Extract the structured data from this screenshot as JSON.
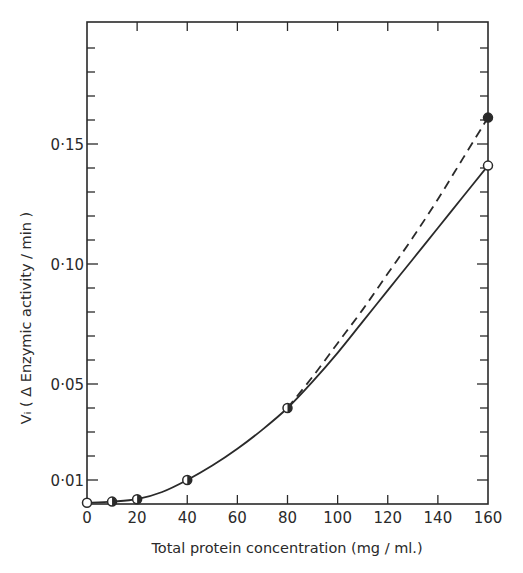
{
  "chart_data": {
    "type": "line",
    "title": "",
    "xlabel": "Total protein concentration (mg / ml.)",
    "ylabel": "Vᵢ ( Δ Enzymic activity / min )",
    "xlim": [
      0,
      160
    ],
    "ylim": [
      0,
      0.2
    ],
    "x_ticks": [
      0,
      20,
      40,
      60,
      80,
      100,
      120,
      140,
      160
    ],
    "x_tick_labels": [
      "0",
      "20",
      "40",
      "60",
      "80",
      "100",
      "120",
      "140",
      "160"
    ],
    "y_labeled_ticks": [
      {
        "value": 0.01,
        "label": "0·01"
      },
      {
        "value": 0.05,
        "label": "0·05"
      },
      {
        "value": 0.1,
        "label": "0·10"
      },
      {
        "value": 0.15,
        "label": "0·15"
      }
    ],
    "y_minor_step": 0.01,
    "grid": false,
    "legend": null,
    "series": [
      {
        "name": "open circles (solid line)",
        "line_style": "solid",
        "marker": "open-circle",
        "x": [
          0,
          10,
          20,
          40,
          80,
          160
        ],
        "values": [
          0.0005,
          0.001,
          0.002,
          0.01,
          0.04,
          0.141
        ],
        "curve": [
          [
            0,
            0.0005
          ],
          [
            10,
            0.001
          ],
          [
            20,
            0.002
          ],
          [
            30,
            0.005
          ],
          [
            40,
            0.01
          ],
          [
            50,
            0.016
          ],
          [
            60,
            0.023
          ],
          [
            70,
            0.031
          ],
          [
            80,
            0.04
          ],
          [
            90,
            0.051
          ],
          [
            100,
            0.063
          ],
          [
            110,
            0.076
          ],
          [
            120,
            0.089
          ],
          [
            130,
            0.102
          ],
          [
            140,
            0.115
          ],
          [
            150,
            0.128
          ],
          [
            160,
            0.141
          ]
        ]
      },
      {
        "name": "filled circles (dashed line)",
        "line_style": "dashed",
        "marker": "filled-circle",
        "x": [
          80,
          160
        ],
        "values": [
          0.04,
          0.161
        ],
        "curve": [
          [
            80,
            0.04
          ],
          [
            90,
            0.053
          ],
          [
            100,
            0.067
          ],
          [
            110,
            0.081
          ],
          [
            120,
            0.096
          ],
          [
            130,
            0.111
          ],
          [
            140,
            0.127
          ],
          [
            150,
            0.144
          ],
          [
            160,
            0.161
          ]
        ]
      }
    ],
    "shared_points_marker": "half-filled-circle",
    "shared_points_x": [
      10,
      20,
      40,
      80
    ]
  },
  "axes": {
    "x_label": "Total protein concentration (mg / ml.)",
    "y_label": "Vᵢ ( Δ Enzymic activity / min )"
  }
}
